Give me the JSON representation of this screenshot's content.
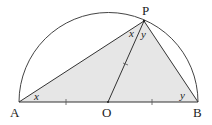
{
  "diagram": {
    "type": "geometry-semicircle",
    "points": {
      "A": {
        "label": "A",
        "x": 19,
        "y": 102
      },
      "O": {
        "label": "O",
        "x": 108,
        "y": 102
      },
      "B": {
        "label": "B",
        "x": 198,
        "y": 102
      },
      "P": {
        "label": "P",
        "x": 144,
        "y": 21
      }
    },
    "angles": {
      "at_A": "x",
      "at_P_left": "x",
      "at_P_right": "y",
      "at_B": "y"
    },
    "colors": {
      "shade": "#e6e6e6",
      "stroke": "#333333"
    }
  }
}
